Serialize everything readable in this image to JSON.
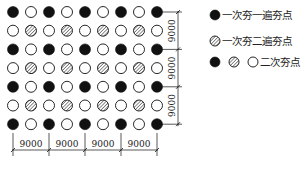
{
  "diagram": {
    "type": "dynamic-compaction-point-layout",
    "grid": {
      "rows": 7,
      "cols": 9,
      "origin_x": 13,
      "origin_y": 12,
      "step_x": 18,
      "step_y": 18.7,
      "radius": 5.5,
      "pattern": [
        [
          "F",
          "O",
          "F",
          "O",
          "F",
          "O",
          "F",
          "O",
          "F"
        ],
        [
          "O",
          "H",
          "O",
          "H",
          "O",
          "H",
          "O",
          "H",
          "O"
        ],
        [
          "F",
          "O",
          "F",
          "O",
          "F",
          "O",
          "F",
          "O",
          "F"
        ],
        [
          "O",
          "H",
          "O",
          "H",
          "O",
          "H",
          "O",
          "H",
          "O"
        ],
        [
          "F",
          "O",
          "F",
          "O",
          "F",
          "O",
          "F",
          "O",
          "F"
        ],
        [
          "O",
          "H",
          "O",
          "H",
          "O",
          "H",
          "O",
          "H",
          "O"
        ],
        [
          "F",
          "O",
          "F",
          "O",
          "F",
          "O",
          "F",
          "O",
          "F"
        ]
      ]
    },
    "dimensions": {
      "vertical": [
        "9000",
        "9000",
        "9000"
      ],
      "horizontal": [
        "9000",
        "9000",
        "9000",
        "9000"
      ]
    },
    "legend": {
      "items": [
        {
          "symbols": [
            "filled"
          ],
          "label": "一次夯一遍夯点"
        },
        {
          "symbols": [
            "hatched"
          ],
          "label": "一次夯二遍夯点"
        },
        {
          "symbols": [
            "filled",
            "hatched",
            "open"
          ],
          "label": "二次夯点"
        }
      ]
    },
    "colors": {
      "ink": "#111111",
      "background": "#ffffff"
    }
  }
}
